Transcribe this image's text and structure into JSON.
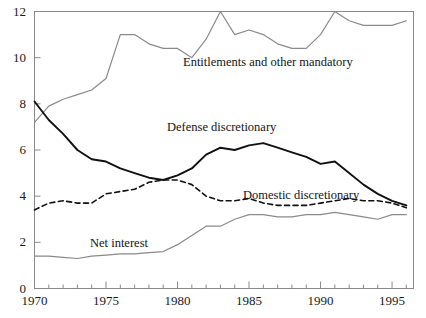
{
  "chart_data": {
    "type": "line",
    "title": "",
    "xlabel": "",
    "ylabel": "",
    "xlim": [
      1970,
      1996.5
    ],
    "ylim": [
      0,
      12
    ],
    "grid": false,
    "legend_position": "inline-annotations",
    "x_tick_labels": [
      "1970",
      "1975",
      "1980",
      "1985",
      "1990",
      "1995"
    ],
    "x_tick_values": [
      1970,
      1975,
      1980,
      1985,
      1990,
      1995
    ],
    "x_minor_tick_interval": 1,
    "y_tick_labels": [
      "0",
      "2",
      "4",
      "6",
      "8",
      "10",
      "12"
    ],
    "y_tick_values": [
      0,
      2,
      4,
      6,
      8,
      10,
      12
    ],
    "x": [
      1970,
      1971,
      1972,
      1973,
      1974,
      1975,
      1976,
      1977,
      1978,
      1979,
      1980,
      1981,
      1982,
      1983,
      1984,
      1985,
      1986,
      1987,
      1988,
      1989,
      1990,
      1991,
      1992,
      1993,
      1994,
      1995,
      1996
    ],
    "series": [
      {
        "name": "Entitlements and other mandatory",
        "style": "solid",
        "color": "#8a8a8a",
        "label_x": 183,
        "label_y": 55,
        "values": [
          7.2,
          7.9,
          8.2,
          8.4,
          8.6,
          9.1,
          11.0,
          11.0,
          10.6,
          10.4,
          10.4,
          10.0,
          10.8,
          12.0,
          11.0,
          11.2,
          11.0,
          10.6,
          10.4,
          10.4,
          11.0,
          12.0,
          11.6,
          11.4,
          11.4,
          11.4,
          11.6
        ]
      },
      {
        "name": "Defense discretionary",
        "style": "solid",
        "color": "#111111",
        "label_x": 167,
        "label_y": 120,
        "values": [
          8.1,
          7.3,
          6.7,
          6.0,
          5.6,
          5.5,
          5.2,
          5.0,
          4.8,
          4.7,
          4.9,
          5.2,
          5.8,
          6.1,
          6.0,
          6.2,
          6.3,
          6.1,
          5.9,
          5.7,
          5.4,
          5.5,
          5.0,
          4.5,
          4.1,
          3.8,
          3.6
        ]
      },
      {
        "name": "Domestic discretionary",
        "style": "dashed",
        "color": "#111111",
        "label_x": 243,
        "label_y": 188,
        "values": [
          3.4,
          3.7,
          3.8,
          3.7,
          3.7,
          4.1,
          4.2,
          4.3,
          4.6,
          4.7,
          4.7,
          4.5,
          4.0,
          3.8,
          3.8,
          3.9,
          3.7,
          3.6,
          3.6,
          3.6,
          3.7,
          3.8,
          3.9,
          3.8,
          3.8,
          3.7,
          3.5
        ]
      },
      {
        "name": "Net interest",
        "style": "solid",
        "color": "#8a8a8a",
        "label_x": 90,
        "label_y": 236,
        "values": [
          1.4,
          1.4,
          1.35,
          1.3,
          1.4,
          1.45,
          1.5,
          1.5,
          1.55,
          1.6,
          1.9,
          2.3,
          2.7,
          2.7,
          3.0,
          3.2,
          3.2,
          3.1,
          3.1,
          3.2,
          3.2,
          3.3,
          3.2,
          3.1,
          3.0,
          3.2,
          3.2
        ]
      }
    ]
  },
  "axes": {
    "frame_color": "#8a8a8a",
    "tick_color": "#8a8a8a"
  }
}
